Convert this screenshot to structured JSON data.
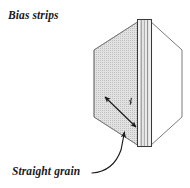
{
  "figure": {
    "kind": "sewing-fabric-fold-diagram",
    "background_color": "#ffffff",
    "labels": {
      "bias_strips": "Bias strips",
      "straight_grain": "Straight grain"
    },
    "colors": {
      "ink": "#1a1a1a",
      "outline": "#555555",
      "panel_fill_shaded": "#dcdcdc",
      "panel_fill_plain": "#ffffff",
      "spine_fill": "#e8e8e8",
      "spine_fill_light": "#f4f4f4",
      "hatch": "#b4b4b4"
    },
    "elements": {
      "shaded_panel": "left folded fabric panel, shaded",
      "plain_panel": "right folded fabric panel, unshaded",
      "fold_spine": "vertical folded edge of fabric",
      "bias_arrow": "double-headed diagonal arrow indicating bias direction",
      "angle_tick": "small angle mark near fold edge",
      "grain_leader": "curved leader line from Straight grain label to fold edge"
    }
  }
}
